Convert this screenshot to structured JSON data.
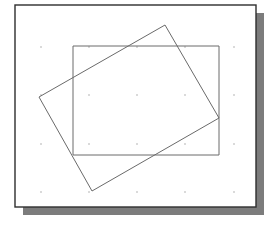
{
  "figure": {
    "type": "cad-drawing-area",
    "colors": {
      "background": "#ffffff",
      "frame_border": "#2e2e2e",
      "shadow": "#7c7c7c",
      "line": "#6a6a6a",
      "grid_dot": "#9a9a9a"
    },
    "frame": {
      "x": 15,
      "y": 5,
      "width": 241,
      "height": 202
    },
    "shadow": {
      "offset_x": 8,
      "offset_y": 8
    },
    "grid": {
      "xs": [
        41,
        89,
        137,
        185,
        234
      ],
      "ys": [
        47,
        95,
        144,
        192
      ]
    },
    "shapes": [
      {
        "name": "axis-aligned-rectangle",
        "points": [
          [
            73,
            46
          ],
          [
            219,
            46
          ],
          [
            219,
            155
          ],
          [
            73,
            155
          ]
        ]
      },
      {
        "name": "rotated-rectangle",
        "points": [
          [
            165,
            25
          ],
          [
            219,
            118
          ],
          [
            92,
            191
          ],
          [
            39,
            97
          ]
        ]
      }
    ]
  }
}
